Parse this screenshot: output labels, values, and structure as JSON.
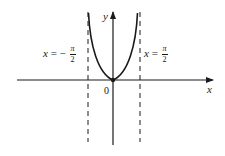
{
  "figure": {
    "axes": {
      "x_label": "x",
      "y_label": "y",
      "origin_label": "0"
    },
    "asymptotes": [
      {
        "var": "x",
        "eq": "=",
        "sign": "−",
        "num": "π",
        "den": "2"
      },
      {
        "var": "x",
        "eq": "=",
        "sign": "",
        "num": "π",
        "den": "2"
      }
    ],
    "colors": {
      "ink": "#1a1a1a",
      "background": "#ffffff"
    }
  }
}
